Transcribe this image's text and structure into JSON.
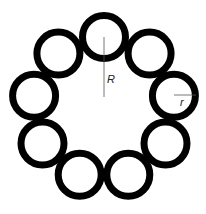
{
  "diagram": {
    "circle_count": 9,
    "ring_center": [
      104,
      108
    ],
    "ring_radius": 71,
    "circle_radius": 21.5,
    "stroke_width": 7,
    "stroke_color": "#000000",
    "background": "#ffffff",
    "labels": {
      "big_radius": "R",
      "small_radius": "r"
    }
  }
}
